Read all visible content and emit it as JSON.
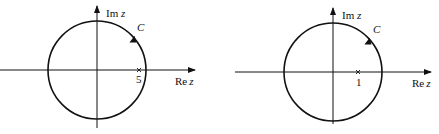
{
  "figures": [
    {
      "id": "left",
      "contour_label": "C",
      "imag_axis_label": "Im",
      "imag_axis_var": "z",
      "real_axis_label": "Re",
      "real_axis_var": "z",
      "marked_point_label": "5",
      "orientation": "counterclockwise"
    },
    {
      "id": "right",
      "contour_label": "C",
      "imag_axis_label": "Im",
      "imag_axis_var": "z",
      "real_axis_label": "Re",
      "real_axis_var": "z",
      "marked_point_label": "1",
      "orientation": "counterclockwise"
    }
  ],
  "colors": {
    "stroke": "#111111",
    "background": "#ffffff"
  }
}
